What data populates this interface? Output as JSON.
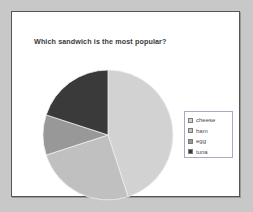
{
  "slide": {
    "title": "Which sandwich is the most popular?",
    "background_color": "#ffffff",
    "border_color": "#555555",
    "outer_background_color": "#c8c8c8"
  },
  "legend": {
    "position": "right",
    "border_color": "#a9a9c4",
    "items": [
      {
        "label": "cheese",
        "color": "#d2d2d2",
        "swatch_icon": "square-swatch-icon"
      },
      {
        "label": "ham",
        "color": "#c0c0c0",
        "swatch_icon": "square-swatch-icon"
      },
      {
        "label": "egg",
        "color": "#989898",
        "swatch_icon": "square-swatch-icon"
      },
      {
        "label": "tuna",
        "color": "#3a3a3a",
        "swatch_icon": "square-swatch-icon"
      }
    ]
  },
  "chart_data": {
    "type": "pie",
    "title": "Which sandwich is the most popular?",
    "xlabel": "",
    "ylabel": "",
    "legend_position": "right",
    "grid": false,
    "start_angle_deg": 0,
    "direction": "clockwise",
    "categories": [
      "cheese",
      "ham",
      "egg",
      "tuna"
    ],
    "values": [
      45,
      25,
      10,
      20
    ],
    "units": "percent",
    "colors": [
      "#d2d2d2",
      "#c0c0c0",
      "#989898",
      "#3a3a3a"
    ],
    "slices": [
      {
        "name": "cheese",
        "value": 45,
        "start_angle_deg": 0,
        "end_angle_deg": 162,
        "color": "#d2d2d2"
      },
      {
        "name": "ham",
        "value": 25,
        "start_angle_deg": 162,
        "end_angle_deg": 252,
        "color": "#c0c0c0"
      },
      {
        "name": "egg",
        "value": 10,
        "start_angle_deg": 252,
        "end_angle_deg": 288,
        "color": "#989898"
      },
      {
        "name": "tuna",
        "value": 20,
        "start_angle_deg": 288,
        "end_angle_deg": 360,
        "color": "#3a3a3a"
      }
    ]
  }
}
